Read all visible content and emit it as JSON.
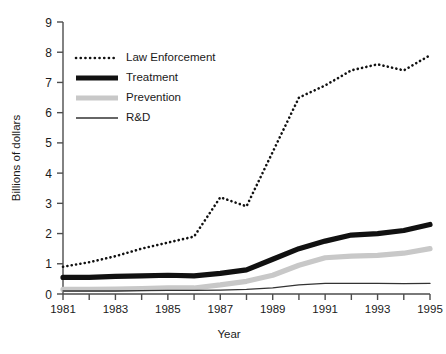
{
  "chart_data": {
    "type": "line",
    "title": "",
    "xlabel": "Year",
    "ylabel": "Billions of dollars",
    "xlim": [
      1981,
      1995
    ],
    "ylim": [
      0,
      9
    ],
    "ytick_step": 1,
    "xtick_step": 1,
    "xtick_label_step": 2,
    "grid": false,
    "legend_position": "upper-left-inside",
    "x": [
      1981,
      1982,
      1983,
      1984,
      1985,
      1986,
      1987,
      1988,
      1989,
      1990,
      1991,
      1992,
      1993,
      1994,
      1995
    ],
    "yticks": [
      0,
      1,
      2,
      3,
      4,
      5,
      6,
      7,
      8,
      9
    ],
    "xticks": [
      1981,
      1982,
      1983,
      1984,
      1985,
      1986,
      1987,
      1988,
      1989,
      1990,
      1991,
      1992,
      1993,
      1994,
      1995
    ],
    "xtick_labels": [
      "1981",
      "",
      "1983",
      "",
      "1985",
      "",
      "1987",
      "",
      "1989",
      "",
      "1991",
      "",
      "1993",
      "",
      "1995"
    ],
    "ytick_labels": [
      "0",
      "1",
      "2",
      "3",
      "4",
      "5",
      "6",
      "7",
      "8",
      "9"
    ],
    "series": [
      {
        "name": "Law Enforcement",
        "style": "dotted",
        "color": "#111111",
        "width": 2.6,
        "values": [
          0.9,
          1.05,
          1.25,
          1.5,
          1.7,
          1.9,
          3.2,
          2.9,
          4.7,
          6.5,
          6.9,
          7.4,
          7.6,
          7.4,
          7.9
        ]
      },
      {
        "name": "Treatment",
        "style": "thick-solid",
        "color": "#111111",
        "width": 5.2,
        "values": [
          0.55,
          0.55,
          0.58,
          0.6,
          0.62,
          0.6,
          0.68,
          0.8,
          1.15,
          1.5,
          1.75,
          1.95,
          2.0,
          2.1,
          2.3
        ]
      },
      {
        "name": "Prevention",
        "style": "thick-solid",
        "color": "#c8c8c8",
        "width": 5.2,
        "values": [
          0.15,
          0.15,
          0.16,
          0.18,
          0.2,
          0.2,
          0.3,
          0.42,
          0.62,
          0.95,
          1.2,
          1.25,
          1.28,
          1.35,
          1.5
        ]
      },
      {
        "name": "R&D",
        "style": "thin-solid",
        "color": "#333333",
        "width": 1.3,
        "values": [
          0.1,
          0.1,
          0.1,
          0.11,
          0.12,
          0.12,
          0.13,
          0.15,
          0.2,
          0.3,
          0.35,
          0.35,
          0.35,
          0.34,
          0.35
        ]
      }
    ]
  },
  "legend": {
    "items": [
      {
        "label": "Law Enforcement"
      },
      {
        "label": "Treatment"
      },
      {
        "label": "Prevention"
      },
      {
        "label": "R&D"
      }
    ]
  },
  "colors": {
    "axis": "#4d4d4d",
    "text": "#1a1a1a",
    "law_enforcement": "#111111",
    "treatment": "#111111",
    "prevention": "#c8c8c8",
    "rd": "#333333",
    "background": "#ffffff"
  }
}
